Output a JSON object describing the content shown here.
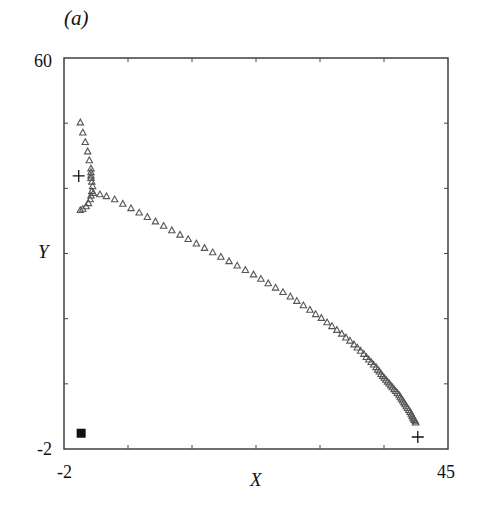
{
  "panel_label": "(a)",
  "chart_data": {
    "type": "scatter",
    "title": "",
    "panel": "(a)",
    "xlabel": "X",
    "ylabel": "Y",
    "xlim": [
      -2,
      45
    ],
    "ylim": [
      -2,
      60
    ],
    "x_tick_labels": [
      "-2",
      "45"
    ],
    "y_tick_labels": [
      "-2",
      "60"
    ],
    "x_minor_ticks": 5,
    "y_minor_ticks": 5,
    "grid": false,
    "legend": null,
    "series": [
      {
        "name": "trajectory",
        "marker": "open-triangle",
        "color": "#555555",
        "points": [
          [
            0.0,
            49.8
          ],
          [
            0.3,
            48.2
          ],
          [
            0.6,
            46.7
          ],
          [
            0.9,
            45.2
          ],
          [
            1.1,
            43.8
          ],
          [
            1.3,
            42.5
          ],
          [
            1.3,
            41.9
          ],
          [
            1.3,
            41.4
          ],
          [
            1.3,
            41.0
          ],
          [
            1.4,
            40.4
          ],
          [
            1.5,
            39.7
          ],
          [
            1.4,
            38.9
          ],
          [
            1.3,
            38.2
          ],
          [
            1.2,
            37.6
          ],
          [
            1.0,
            37.0
          ],
          [
            0.7,
            36.5
          ],
          [
            0.3,
            36.1
          ],
          [
            0.0,
            35.9
          ],
          [
            1.6,
            38.6
          ],
          [
            2.4,
            38.4
          ],
          [
            3.2,
            38.1
          ],
          [
            4.2,
            37.6
          ],
          [
            5.2,
            36.9
          ],
          [
            6.2,
            36.2
          ],
          [
            7.2,
            35.5
          ],
          [
            8.2,
            34.8
          ],
          [
            9.2,
            34.1
          ],
          [
            10.2,
            33.4
          ],
          [
            11.2,
            32.7
          ],
          [
            12.2,
            32.0
          ],
          [
            13.2,
            31.3
          ],
          [
            14.2,
            30.6
          ],
          [
            15.2,
            29.9
          ],
          [
            16.2,
            29.2
          ],
          [
            17.2,
            28.5
          ],
          [
            18.2,
            27.8
          ],
          [
            19.2,
            27.1
          ],
          [
            20.2,
            26.4
          ],
          [
            21.2,
            25.7
          ],
          [
            22.1,
            25.0
          ],
          [
            23.0,
            24.3
          ],
          [
            23.9,
            23.6
          ],
          [
            24.8,
            22.9
          ],
          [
            25.7,
            22.2
          ],
          [
            26.5,
            21.5
          ],
          [
            27.3,
            20.8
          ],
          [
            28.1,
            20.1
          ],
          [
            28.8,
            19.4
          ],
          [
            29.5,
            18.8
          ],
          [
            30.2,
            18.1
          ],
          [
            30.8,
            17.5
          ],
          [
            31.4,
            16.9
          ],
          [
            32.0,
            16.3
          ],
          [
            32.5,
            15.7
          ],
          [
            33.0,
            15.2
          ],
          [
            33.5,
            14.6
          ],
          [
            33.9,
            14.1
          ],
          [
            34.3,
            13.6
          ],
          [
            34.7,
            13.1
          ],
          [
            35.0,
            12.6
          ],
          [
            35.3,
            12.2
          ],
          [
            35.6,
            11.8
          ],
          [
            35.9,
            11.4
          ],
          [
            36.2,
            11.0
          ],
          [
            36.4,
            10.6
          ],
          [
            36.6,
            10.3
          ],
          [
            36.8,
            9.9
          ],
          [
            37.0,
            9.6
          ],
          [
            37.2,
            9.3
          ],
          [
            37.4,
            9.0
          ],
          [
            37.6,
            8.7
          ],
          [
            37.8,
            8.4
          ],
          [
            38.0,
            8.1
          ],
          [
            38.2,
            7.8
          ],
          [
            38.4,
            7.5
          ],
          [
            38.6,
            7.2
          ],
          [
            38.8,
            6.9
          ],
          [
            39.0,
            6.6
          ],
          [
            39.15,
            6.3
          ],
          [
            39.3,
            6.0
          ],
          [
            39.45,
            5.7
          ],
          [
            39.6,
            5.4
          ],
          [
            39.75,
            5.1
          ],
          [
            39.9,
            4.8
          ],
          [
            40.05,
            4.5
          ],
          [
            40.2,
            4.2
          ],
          [
            40.35,
            3.9
          ],
          [
            40.5,
            3.6
          ],
          [
            40.6,
            3.3
          ],
          [
            40.7,
            3.0
          ],
          [
            40.8,
            2.8
          ],
          [
            40.9,
            2.6
          ],
          [
            41.0,
            2.4
          ],
          [
            41.05,
            2.2
          ]
        ]
      },
      {
        "name": "cross-markers",
        "marker": "plus",
        "color": "#111111",
        "points": [
          [
            -0.2,
            41.3
          ],
          [
            41.3,
            -0.1
          ]
        ]
      },
      {
        "name": "square-marker",
        "marker": "filled-square",
        "color": "#111111",
        "points": [
          [
            0.1,
            0.5
          ]
        ]
      }
    ]
  }
}
